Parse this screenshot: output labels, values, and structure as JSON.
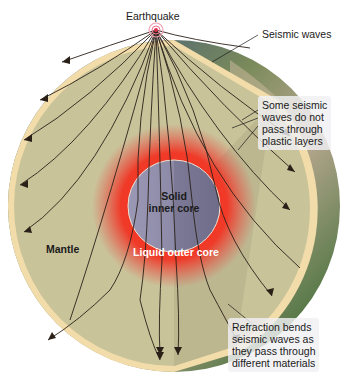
{
  "diagram": {
    "labels": {
      "earthquake": "Earthquake",
      "seismic_waves": "Seismic waves",
      "plastic_layers_note": [
        "Some seismic",
        "waves do not",
        "pass through",
        "plastic layers"
      ],
      "inner_core": [
        "Solid",
        "inner core"
      ],
      "outer_core": "Liquid outer core",
      "mantle": "Mantle",
      "refraction_note": [
        "Refraction bends",
        "seismic waves as",
        "they pass through",
        "different materials"
      ]
    },
    "colors": {
      "mantle": "#c9c39a",
      "crust": "#f2dcaa",
      "outer_core": "#e8372a",
      "inner_core": "#8a8aa6",
      "ocean": "#1f3f8a",
      "land": "#8a9a5a",
      "wave_line": "#2a2018",
      "focus": "#e0304a"
    }
  }
}
